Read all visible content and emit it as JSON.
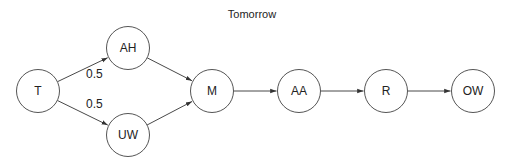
{
  "title": "Tomorrow",
  "nodes": [
    {
      "id": "T",
      "label": "T"
    },
    {
      "id": "AH",
      "label": "AH"
    },
    {
      "id": "UW",
      "label": "UW"
    },
    {
      "id": "M",
      "label": "M"
    },
    {
      "id": "AA",
      "label": "AA"
    },
    {
      "id": "R",
      "label": "R"
    },
    {
      "id": "OW",
      "label": "OW"
    }
  ],
  "edges": [
    {
      "from": "T",
      "to": "AH",
      "label": "0.5"
    },
    {
      "from": "T",
      "to": "UW",
      "label": "0.5"
    },
    {
      "from": "AH",
      "to": "M",
      "label": ""
    },
    {
      "from": "UW",
      "to": "M",
      "label": ""
    },
    {
      "from": "M",
      "to": "AA",
      "label": ""
    },
    {
      "from": "AA",
      "to": "R",
      "label": ""
    },
    {
      "from": "R",
      "to": "OW",
      "label": ""
    }
  ]
}
